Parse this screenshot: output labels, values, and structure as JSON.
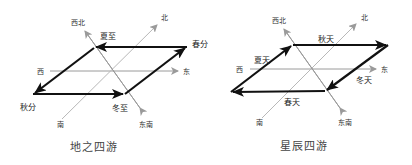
{
  "colors": {
    "axis": "#9a9a9a",
    "path": "#111111",
    "text": "#333333",
    "caption": "#444444"
  },
  "diagrams": [
    {
      "caption": "地之四游",
      "directions": {
        "northwest": "西北",
        "north": "北",
        "west": "西",
        "east": "东",
        "south": "南",
        "southeast": "东南"
      },
      "points": [
        {
          "label": "夏至",
          "position": "top-left"
        },
        {
          "label": "春分",
          "position": "top-right"
        },
        {
          "label": "秋分",
          "position": "bottom-left"
        },
        {
          "label": "冬至",
          "position": "bottom-right"
        }
      ],
      "arrows": [
        "春分→夏至",
        "夏至→秋分",
        "秋分→冬至",
        "冬至→春分"
      ]
    },
    {
      "caption": "星辰四游",
      "directions": {
        "northwest": "西北",
        "north": "北",
        "west": "西",
        "east": "东",
        "south": "南",
        "southeast": "东南"
      },
      "segments": [
        {
          "label": "夏天",
          "position": "left-edge"
        },
        {
          "label": "秋天",
          "position": "top-edge"
        },
        {
          "label": "冬天",
          "position": "right-edge"
        },
        {
          "label": "春天",
          "position": "bottom-edge"
        }
      ],
      "arrows": [
        "夏天: bottom-left→top-left",
        "秋天: top-left→top-right",
        "冬天: top-right→bottom-right",
        "春天: bottom-right→bottom-left"
      ]
    }
  ]
}
